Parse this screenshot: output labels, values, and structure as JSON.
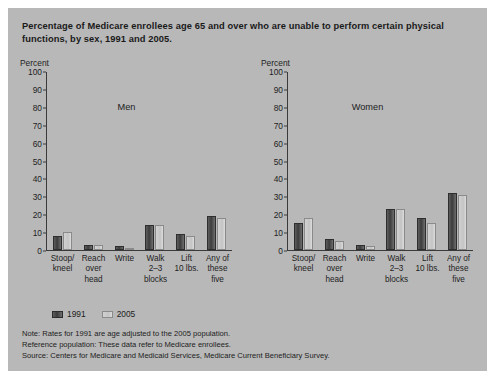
{
  "title": "Percentage of Medicare enrollees age 65 and over who are unable to perform certain physical functions, by sex, 1991 and 2005.",
  "axis_unit_label": "Percent",
  "legend": [
    {
      "label": "1991",
      "color": "#3c3c3c"
    },
    {
      "label": "2005",
      "color": "#c8c8c8"
    }
  ],
  "notes": [
    "Note: Rates for 1991 are age adjusted to the 2005 population.",
    "Reference population: These data refer to Medicare enrollees.",
    "Source: Centers for Medicare and Medicaid Services, Medicare Current Beneficiary Survey."
  ],
  "yticks": [
    100,
    90,
    80,
    70,
    60,
    50,
    40,
    30,
    20,
    10,
    0
  ],
  "chart_data": [
    {
      "type": "bar",
      "title": "Men",
      "xlabel": "",
      "ylabel": "Percent",
      "ylim": [
        0,
        100
      ],
      "grid": false,
      "legend_position": "below",
      "categories": [
        "Stoop/ kneel",
        "Reach over head",
        "Write",
        "Walk 2-3 blocks",
        "Lift 10 lbs.",
        "Any of these five"
      ],
      "series": [
        {
          "name": "1991",
          "values": [
            8,
            3,
            2,
            14,
            9,
            19
          ]
        },
        {
          "name": "2005",
          "values": [
            10,
            3,
            1,
            14,
            8,
            18
          ]
        }
      ]
    },
    {
      "type": "bar",
      "title": "Women",
      "xlabel": "",
      "ylabel": "Percent",
      "ylim": [
        0,
        100
      ],
      "grid": false,
      "legend_position": "below",
      "categories": [
        "Stoop/ kneel",
        "Reach over head",
        "Write",
        "Walk 2-3 blocks",
        "Lift 10 lbs.",
        "Any of these five"
      ],
      "series": [
        {
          "name": "1991",
          "values": [
            15,
            6,
            3,
            23,
            18,
            32
          ]
        },
        {
          "name": "2005",
          "values": [
            18,
            5,
            2,
            23,
            15,
            31
          ]
        }
      ]
    }
  ],
  "categories_display": [
    [
      "Stoop/",
      "kneel",
      ""
    ],
    [
      "Reach",
      "over",
      "head"
    ],
    [
      "Write",
      "",
      ""
    ],
    [
      "Walk",
      "2–3",
      "blocks"
    ],
    [
      "Lift",
      "10 lbs.",
      ""
    ],
    [
      "Any of",
      "these",
      "five"
    ]
  ]
}
